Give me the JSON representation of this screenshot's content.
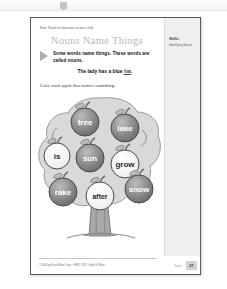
{
  "viewer": {
    "toolbar_icon": "document-icon"
  },
  "worksheet": {
    "directions": "Note: Read the directions to your child.",
    "title": "Nouns Name Things",
    "lead_text": "Some words name things. These words are called nouns.",
    "example_prefix": "The lady has a blue ",
    "example_highlight": "hat",
    "example_suffix": ".",
    "task": "Color each apple that names something.",
    "skills_label": "Skills:",
    "skills_value": "Identifying Nouns",
    "copyright": "©2006 by Evan-Moor Corp. • EMC 4537 • Spell & Write",
    "footer_label": "Nouns",
    "page_number": "27"
  },
  "tree": {
    "apples": [
      {
        "word": "tree",
        "is_noun": true,
        "colored": true,
        "cx": 48,
        "cy": 28,
        "r": 14
      },
      {
        "word": "lake",
        "is_noun": true,
        "colored": true,
        "cx": 88,
        "cy": 34,
        "r": 14
      },
      {
        "word": "is",
        "is_noun": false,
        "colored": false,
        "cx": 20,
        "cy": 62,
        "r": 13
      },
      {
        "word": "sun",
        "is_noun": true,
        "colored": true,
        "cx": 53,
        "cy": 64,
        "r": 14
      },
      {
        "word": "grow",
        "is_noun": false,
        "colored": false,
        "cx": 88,
        "cy": 70,
        "r": 14
      },
      {
        "word": "rake",
        "is_noun": true,
        "colored": true,
        "cx": 26,
        "cy": 98,
        "r": 14
      },
      {
        "word": "after",
        "is_noun": false,
        "colored": false,
        "cx": 63,
        "cy": 102,
        "r": 14
      },
      {
        "word": "snow",
        "is_noun": true,
        "colored": true,
        "cx": 102,
        "cy": 95,
        "r": 14
      }
    ],
    "colors": {
      "foliage": "#d7d7d7",
      "foliage_edge": "#8f8f8f",
      "apple_colored": "#8c8c8c",
      "apple_white": "#fbfbfb",
      "apple_outline": "#4a4a4a",
      "trunk": "#9a9a9a",
      "stem": "#707070"
    }
  }
}
